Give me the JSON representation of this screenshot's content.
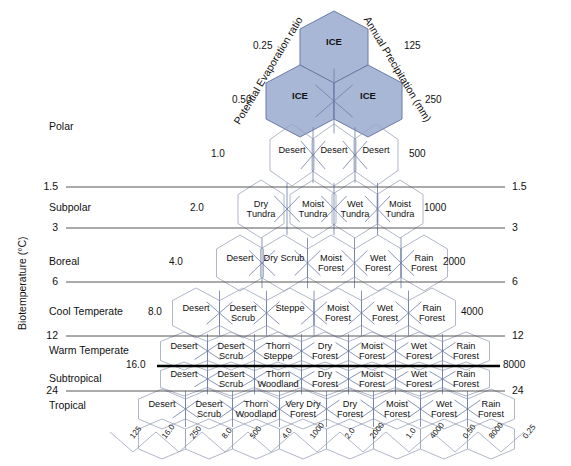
{
  "figure": {
    "type": "holdridge-life-zones",
    "y_axis_title": "Biotemperature (°C)",
    "left_diagonal_axis_title": "Potential Evaporation ratio",
    "right_diagonal_axis_title": "Annual Precipitation (mm)",
    "frost_line_label_left": "16.0",
    "frost_line_label_right": "8000"
  },
  "latitudinal_regions": [
    {
      "label": "Polar",
      "y": 127
    },
    {
      "label": "Subpolar",
      "y": 208
    },
    {
      "label": "Boreal",
      "y": 262
    },
    {
      "label": "Cool Temperate",
      "y": 312
    },
    {
      "label": "Warm Temperate",
      "y": 351
    },
    {
      "label": "Subtropical",
      "y": 379
    },
    {
      "label": "Tropical",
      "y": 406
    }
  ],
  "temperature_ticks": [
    {
      "value": "1.5",
      "y": 187
    },
    {
      "value": "3",
      "y": 228
    },
    {
      "value": "6",
      "y": 282
    },
    {
      "value": "12",
      "y": 336
    },
    {
      "value": "24",
      "y": 391
    }
  ],
  "pet_ratio_labels": [
    {
      "value": "0.25",
      "x": 253,
      "y": 47
    },
    {
      "value": "0.50",
      "x": 232,
      "y": 101
    },
    {
      "value": "1.0",
      "x": 211,
      "y": 155
    },
    {
      "value": "2.0",
      "x": 190,
      "y": 209
    },
    {
      "value": "4.0",
      "x": 169,
      "y": 263
    },
    {
      "value": "8.0",
      "x": 148,
      "y": 313
    },
    {
      "value": "16.0",
      "x": 126,
      "y": 366
    }
  ],
  "precipitation_labels": [
    {
      "value": "125",
      "x": 404,
      "y": 47
    },
    {
      "value": "250",
      "x": 425,
      "y": 101
    },
    {
      "value": "500",
      "x": 409,
      "y": 155
    },
    {
      "value": "1000",
      "x": 424,
      "y": 209
    },
    {
      "value": "2000",
      "x": 443,
      "y": 263
    },
    {
      "value": "4000",
      "x": 461,
      "y": 313
    },
    {
      "value": "8000",
      "x": 503,
      "y": 366
    }
  ],
  "right_temperature_ticks": [
    {
      "value": "1.5",
      "y": 187
    },
    {
      "value": "3",
      "y": 228
    },
    {
      "value": "6",
      "y": 282
    },
    {
      "value": "12",
      "y": 336
    },
    {
      "value": "24",
      "y": 391
    }
  ],
  "bottom_axis_labels": [
    {
      "value": "125",
      "x": 128,
      "y": 441
    },
    {
      "value": "16.0",
      "x": 160,
      "y": 441
    },
    {
      "value": "250",
      "x": 188,
      "y": 441
    },
    {
      "value": "8.0",
      "x": 220,
      "y": 441
    },
    {
      "value": "500",
      "x": 248,
      "y": 441
    },
    {
      "value": "4.0",
      "x": 280,
      "y": 441
    },
    {
      "value": "1000",
      "x": 308,
      "y": 441
    },
    {
      "value": "2.0",
      "x": 343,
      "y": 441
    },
    {
      "value": "2000",
      "x": 368,
      "y": 441
    },
    {
      "value": "1.0",
      "x": 404,
      "y": 441
    },
    {
      "value": "4000",
      "x": 428,
      "y": 441
    },
    {
      "value": "0.50",
      "x": 461,
      "y": 441
    },
    {
      "value": "8000",
      "x": 487,
      "y": 441
    },
    {
      "value": "0.25",
      "x": 521,
      "y": 441
    }
  ],
  "zones": [
    {
      "label": "ICE",
      "ice": true,
      "cx": 334,
      "cy": 47
    },
    {
      "label": "ICE",
      "ice": true,
      "cx": 300,
      "cy": 101
    },
    {
      "label": "ICE",
      "ice": true,
      "cx": 368,
      "cy": 101
    },
    {
      "label": "Desert",
      "cx": 292,
      "cy": 155
    },
    {
      "label": "Desert",
      "cx": 334,
      "cy": 155
    },
    {
      "label": "Desert",
      "cx": 376,
      "cy": 155
    },
    {
      "label": "Dry Tundra",
      "cx": 261,
      "cy": 209
    },
    {
      "label": "Moist Tundra",
      "cx": 313,
      "cy": 209
    },
    {
      "label": "Wet Tundra",
      "cx": 355,
      "cy": 209
    },
    {
      "label": "Moist Tundra",
      "cx": 400,
      "cy": 209
    },
    {
      "label": "Desert",
      "cx": 240,
      "cy": 263
    },
    {
      "label": "Dry Scrub",
      "cx": 284,
      "cy": 263
    },
    {
      "label": "Moist Forest",
      "cx": 331,
      "cy": 263
    },
    {
      "label": "Wet Forest",
      "cx": 378,
      "cy": 263
    },
    {
      "label": "Rain Forest",
      "cx": 424,
      "cy": 263
    },
    {
      "label": "Desert",
      "cx": 196,
      "cy": 313
    },
    {
      "label": "Desert Scrub",
      "cx": 243,
      "cy": 313
    },
    {
      "label": "Steppe",
      "cx": 290,
      "cy": 313
    },
    {
      "label": "Moist Forest",
      "cx": 338,
      "cy": 313
    },
    {
      "label": "Wet Forest",
      "cx": 385,
      "cy": 313
    },
    {
      "label": "Rain Forest",
      "cx": 432,
      "cy": 313
    },
    {
      "label": "Desert",
      "cx": 184,
      "cy": 351
    },
    {
      "label": "Desert Scrub",
      "cx": 231,
      "cy": 351
    },
    {
      "label": "Thorn Steppe",
      "cx": 278,
      "cy": 351
    },
    {
      "label": "Dry Forest",
      "cx": 325,
      "cy": 351
    },
    {
      "label": "Moist Forest",
      "cx": 372,
      "cy": 351
    },
    {
      "label": "Wet Forest",
      "cx": 419,
      "cy": 351
    },
    {
      "label": "Rain Forest",
      "cx": 466,
      "cy": 351
    },
    {
      "label": "Desert",
      "cx": 184,
      "cy": 379
    },
    {
      "label": "Desert Scrub",
      "cx": 231,
      "cy": 379
    },
    {
      "label": "Thorn Woodland",
      "cx": 278,
      "cy": 379
    },
    {
      "label": "Dry Forest",
      "cx": 325,
      "cy": 379
    },
    {
      "label": "Moist Forest",
      "cx": 372,
      "cy": 379
    },
    {
      "label": "Wet Forest",
      "cx": 419,
      "cy": 379
    },
    {
      "label": "Rain Forest",
      "cx": 466,
      "cy": 379
    },
    {
      "label": "Desert",
      "cx": 162,
      "cy": 409
    },
    {
      "label": "Desert Scrub",
      "cx": 209,
      "cy": 409
    },
    {
      "label": "Thorn Woodland",
      "cx": 256,
      "cy": 409
    },
    {
      "label": "Very Dry Forest",
      "cx": 303,
      "cy": 409
    },
    {
      "label": "Dry Forest",
      "cx": 350,
      "cy": 409
    },
    {
      "label": "Moist Forest",
      "cx": 397,
      "cy": 409
    },
    {
      "label": "Wet Forest",
      "cx": 444,
      "cy": 409
    },
    {
      "label": "Rain Forest",
      "cx": 491,
      "cy": 409
    }
  ],
  "colors": {
    "ice_fill": "#a9b7d6",
    "hex_stroke": "#9aa3ba",
    "diag_stroke": "#6b7ba6",
    "gridline": "#444444",
    "frostline": "#000000"
  }
}
